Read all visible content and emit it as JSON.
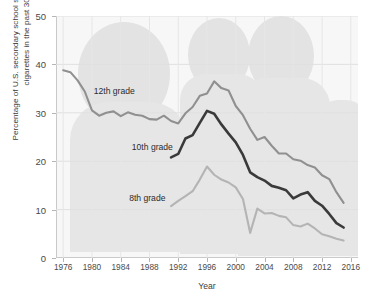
{
  "chart_data": {
    "type": "line",
    "title": "",
    "xlabel": "Year",
    "ylabel": "Percentage of U.S. secondary school students who smoked cigarettes in the past 30 days",
    "xlim": [
      1975,
      2017
    ],
    "ylim": [
      0,
      50
    ],
    "x_ticks": [
      1976,
      1980,
      1984,
      1988,
      1992,
      1996,
      2000,
      2004,
      2008,
      2012,
      2016
    ],
    "y_ticks": [
      0,
      10,
      20,
      30,
      40,
      50
    ],
    "grid": true,
    "legend_position": "inline-annotations",
    "background_watermark": "photograph of school students",
    "series": [
      {
        "name": "12th grade",
        "color": "#909090",
        "label_x": 1983.1,
        "label_y": 34.6,
        "x": [
          1976,
          1977,
          1978,
          1979,
          1980,
          1981,
          1982,
          1983,
          1984,
          1985,
          1986,
          1987,
          1988,
          1989,
          1990,
          1991,
          1992,
          1993,
          1994,
          1995,
          1996,
          1997,
          1998,
          1999,
          2000,
          2001,
          2002,
          2003,
          2004,
          2005,
          2006,
          2007,
          2008,
          2009,
          2010,
          2011,
          2012,
          2013,
          2014,
          2015
        ],
        "y": [
          38.8,
          38.4,
          36.7,
          34.4,
          30.5,
          29.4,
          30.0,
          30.3,
          29.3,
          30.1,
          29.6,
          29.4,
          28.7,
          28.6,
          29.4,
          28.3,
          27.8,
          29.9,
          31.2,
          33.5,
          34.0,
          36.5,
          35.1,
          34.6,
          31.4,
          29.5,
          26.7,
          24.4,
          25.0,
          23.2,
          21.6,
          21.6,
          20.4,
          20.1,
          19.2,
          18.7,
          17.1,
          16.3,
          13.6,
          11.4
        ]
      },
      {
        "name": "10th grade",
        "color": "#3a3a3a",
        "label_x": 1988.4,
        "label_y": 22.9,
        "x": [
          1991,
          1992,
          1993,
          1994,
          1995,
          1996,
          1997,
          1998,
          1999,
          2000,
          2001,
          2002,
          2003,
          2004,
          2005,
          2006,
          2007,
          2008,
          2009,
          2010,
          2011,
          2012,
          2013,
          2014,
          2015
        ],
        "y": [
          20.8,
          21.5,
          24.7,
          25.4,
          27.9,
          30.4,
          29.8,
          27.6,
          25.7,
          23.9,
          21.3,
          17.7,
          16.7,
          16.0,
          14.9,
          14.5,
          14.0,
          12.3,
          13.1,
          13.6,
          11.8,
          10.8,
          9.1,
          7.2,
          6.3
        ]
      },
      {
        "name": "8th grade",
        "color": "#b4b4b4",
        "label_x": 1987.7,
        "label_y": 12.4,
        "x": [
          1991,
          1992,
          1993,
          1994,
          1995,
          1996,
          1997,
          1998,
          1999,
          2000,
          2001,
          2002,
          2003,
          2004,
          2005,
          2006,
          2007,
          2008,
          2009,
          2010,
          2011,
          2012,
          2013,
          2014,
          2015
        ],
        "y": [
          10.7,
          11.8,
          12.8,
          13.8,
          16.2,
          18.9,
          17.2,
          16.2,
          15.6,
          14.6,
          12.2,
          5.2,
          10.2,
          9.2,
          9.3,
          8.7,
          8.4,
          6.8,
          6.5,
          7.1,
          6.1,
          4.9,
          4.5,
          4.0,
          3.6
        ]
      }
    ]
  },
  "axes": {
    "x_title": "Year",
    "y_title": "Percentage of U.S. secondary school students who smoked cigarettes in the past 30 days",
    "x_tick_labels": [
      "1976",
      "1980",
      "1984",
      "1988",
      "1992",
      "1996",
      "2000",
      "2004",
      "2008",
      "2012",
      "2016"
    ],
    "y_tick_labels": [
      "0",
      "10",
      "20",
      "30",
      "40",
      "50"
    ]
  },
  "annotations": {
    "grade12": "12th grade",
    "grade10": "10th grade",
    "grade8": "8th grade"
  },
  "colors": {
    "grade12": "#909090",
    "grade10": "#3a3a3a",
    "grade8": "#b4b4b4",
    "grid": "#e0e0e0",
    "plot_background": "#f7f7f7"
  }
}
